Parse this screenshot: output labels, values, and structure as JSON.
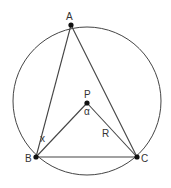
{
  "diagram": {
    "type": "geometry",
    "colors": {
      "line": "#444444",
      "point": "#111111",
      "text": "#333333",
      "background": "#ffffff"
    },
    "circle": {
      "center": "P",
      "cx": 87,
      "cy": 101,
      "r": 74
    },
    "points": [
      {
        "id": "A",
        "label": "A",
        "x": 71,
        "y": 25,
        "label_x": 66,
        "label_y": 20
      },
      {
        "id": "B",
        "label": "B",
        "x": 36,
        "y": 157,
        "label_x": 25,
        "label_y": 162
      },
      {
        "id": "C",
        "label": "C",
        "x": 137,
        "y": 157,
        "label_x": 141,
        "label_y": 162
      },
      {
        "id": "P",
        "label": "P",
        "x": 87,
        "y": 103,
        "label_x": 84,
        "label_y": 98
      }
    ],
    "segments": [
      {
        "from": "A",
        "to": "B"
      },
      {
        "from": "A",
        "to": "C"
      },
      {
        "from": "B",
        "to": "C"
      },
      {
        "from": "P",
        "to": "B"
      },
      {
        "from": "P",
        "to": "C"
      }
    ],
    "annotations": [
      {
        "id": "alpha",
        "text": "α",
        "x": 84,
        "y": 115,
        "meaning": "central angle BPC"
      },
      {
        "id": "x",
        "text": "x",
        "x": 40,
        "y": 142,
        "meaning": "angle PBC"
      },
      {
        "id": "R",
        "text": "R",
        "x": 102,
        "y": 137,
        "meaning": "radius PC"
      }
    ]
  }
}
